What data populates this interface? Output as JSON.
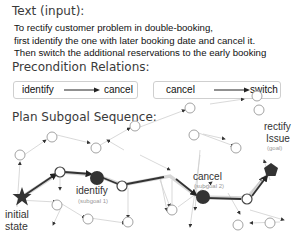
{
  "text_input": {
    "heading": "Text (input):",
    "lines": [
      "To rectify customer problem in double-booking,",
      "first identify the one with later booking date and cancel it.",
      "Then switch the additional reservations to the early booking"
    ]
  },
  "precondition": {
    "heading": "Precondition Relations:",
    "relations": [
      {
        "from": "identify",
        "to": "cancel"
      },
      {
        "from": "cancel",
        "to": "switch"
      }
    ]
  },
  "plan": {
    "heading": "Plan Subgoal Sequence:",
    "start": {
      "label_line1": "initial",
      "label_line2": "state"
    },
    "subgoal1": {
      "label": "identify",
      "sub": "(subgoal 1)"
    },
    "subgoal2": {
      "label": "cancel",
      "sub": "(subgoal 2)"
    },
    "goal": {
      "label_line1": "rectify",
      "label_line2": "Issue",
      "sub": "(goal)"
    }
  }
}
